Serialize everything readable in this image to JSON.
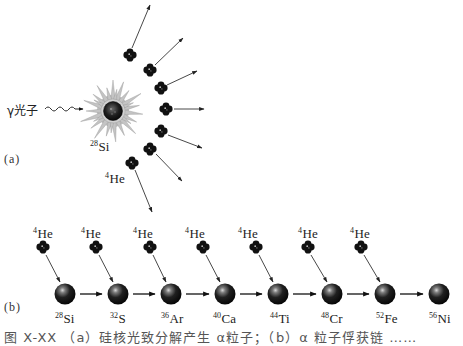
{
  "panel_a": {
    "label": "(a)",
    "photon_label": "γ光子",
    "target_nucleus": {
      "mass": "28",
      "symbol": "Si"
    },
    "emitted_particle": {
      "mass": "4",
      "symbol": "He"
    },
    "alpha_count": 7
  },
  "panel_b": {
    "label": "(b)",
    "capture_particle": {
      "mass": "4",
      "symbol": "He"
    },
    "chain": [
      {
        "mass": "28",
        "symbol": "Si"
      },
      {
        "mass": "32",
        "symbol": "S"
      },
      {
        "mass": "36",
        "symbol": "Ar"
      },
      {
        "mass": "40",
        "symbol": "Ca"
      },
      {
        "mass": "44",
        "symbol": "Ti"
      },
      {
        "mass": "48",
        "symbol": "Cr"
      },
      {
        "mass": "52",
        "symbol": "Fe"
      },
      {
        "mass": "56",
        "symbol": "Ni"
      }
    ]
  },
  "caption": "图 X-XX （a）硅核光致分解产生 α粒子；（b）α 粒子俘获链 ……"
}
